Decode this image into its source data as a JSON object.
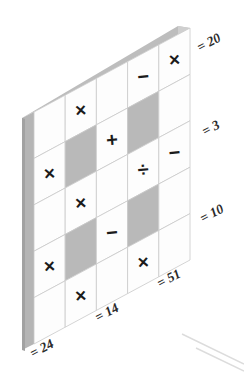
{
  "puzzle": {
    "title": "math-grid-puzzle",
    "rows": 5,
    "cols": 5,
    "cells": [
      [
        {
          "glyph": "",
          "shaded": false
        },
        {
          "glyph": "×",
          "shaded": false
        },
        {
          "glyph": "",
          "shaded": false
        },
        {
          "glyph": "−",
          "shaded": false
        },
        {
          "glyph": "×",
          "shaded": false
        }
      ],
      [
        {
          "glyph": "×",
          "shaded": false
        },
        {
          "glyph": "",
          "shaded": true
        },
        {
          "glyph": "+",
          "shaded": false
        },
        {
          "glyph": "",
          "shaded": true
        },
        {
          "glyph": "",
          "shaded": false
        }
      ],
      [
        {
          "glyph": "",
          "shaded": false
        },
        {
          "glyph": "×",
          "shaded": false
        },
        {
          "glyph": "",
          "shaded": false
        },
        {
          "glyph": "÷",
          "shaded": false
        },
        {
          "glyph": "−",
          "shaded": false
        }
      ],
      [
        {
          "glyph": "×",
          "shaded": false
        },
        {
          "glyph": "",
          "shaded": true
        },
        {
          "glyph": "−",
          "shaded": false
        },
        {
          "glyph": "",
          "shaded": true
        },
        {
          "glyph": "",
          "shaded": false
        }
      ],
      [
        {
          "glyph": "",
          "shaded": false
        },
        {
          "glyph": "×",
          "shaded": false
        },
        {
          "glyph": "",
          "shaded": false
        },
        {
          "glyph": "×",
          "shaded": false
        },
        {
          "glyph": "",
          "shaded": false
        }
      ]
    ],
    "row_results": [
      {
        "id": "row-result-1",
        "text": "= 20",
        "value": 20
      },
      {
        "id": "row-result-2",
        "text": "= 3",
        "value": 3
      },
      {
        "id": "row-result-3",
        "text": "= 10",
        "value": 10
      }
    ],
    "column_results": [
      {
        "id": "col-result-1",
        "text": "= 24",
        "value": 24
      },
      {
        "id": "col-result-2",
        "text": "= 14",
        "value": 14
      },
      {
        "id": "col-result-3",
        "text": "= 51",
        "value": 51
      }
    ],
    "operators_legend": {
      "multiply": "×",
      "divide": "÷",
      "plus": "+",
      "minus": "−"
    },
    "colors": {
      "cell_white": "#fdfdfd",
      "cell_shaded": "#b9b9b9",
      "edge_left": "#b5b5b5",
      "edge_top": "#bdbdbd",
      "grid_line": "#c9c9c9",
      "glyph": "#1b1b1b",
      "label": "#2a2a2a",
      "background": "#ffffff"
    }
  }
}
